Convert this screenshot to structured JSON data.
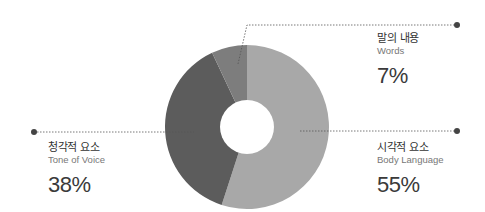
{
  "chart_data": {
    "type": "pie",
    "variant": "donut",
    "title": "",
    "slices": [
      {
        "label_ko": "시각적 요소",
        "label_en": "Body Language",
        "value": 55,
        "display": "55%",
        "color": "#a8a8a8"
      },
      {
        "label_ko": "청각적 요소",
        "label_en": "Tone of Voice",
        "value": 38,
        "display": "38%",
        "color": "#5c5c5c"
      },
      {
        "label_ko": "말의 내용",
        "label_en": "Words",
        "value": 7,
        "display": "7%",
        "color": "#7d7d7d"
      }
    ],
    "start_angle": "top",
    "direction": "clockwise",
    "legend": "callout labels with dotted leader lines"
  },
  "labels": {
    "words": {
      "ko": "말의 내용",
      "en": "Words",
      "pct": "7%"
    },
    "tone": {
      "ko": "청각적 요소",
      "en": "Tone of Voice",
      "pct": "38%"
    },
    "body": {
      "ko": "시각적 요소",
      "en": "Body Language",
      "pct": "55%"
    }
  },
  "colors": {
    "leader": "#555555",
    "dot": "#444444"
  }
}
